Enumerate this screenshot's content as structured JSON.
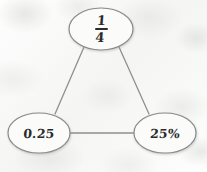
{
  "diagram": {
    "style": {
      "background_color": "#f6f6f5",
      "node_fill_color": "#fbfbfa",
      "node_stroke_color": "#8a8a8a",
      "edge_stroke_color": "#8f8f8f",
      "text_color": "#2b2b2b"
    },
    "nodes": [
      {
        "id": "fraction-node",
        "label": "1/4",
        "kind": "fraction",
        "numerator": "1",
        "denominator": "4",
        "cx": 101,
        "cy": 29,
        "rx": 32,
        "ry": 21
      },
      {
        "id": "decimal-node",
        "label": "0.25",
        "kind": "text",
        "cx": 39,
        "cy": 133,
        "rx": 31,
        "ry": 20
      },
      {
        "id": "percent-node",
        "label": "25%",
        "kind": "text",
        "cx": 165,
        "cy": 133,
        "rx": 31,
        "ry": 20
      }
    ],
    "edges": [
      {
        "id": "edge-fraction-decimal",
        "from": "fraction-node",
        "to": "decimal-node",
        "x1": 84,
        "y1": 47,
        "x2": 55,
        "y2": 114
      },
      {
        "id": "edge-fraction-percent",
        "from": "fraction-node",
        "to": "percent-node",
        "x1": 119,
        "y1": 47,
        "x2": 149,
        "y2": 114
      },
      {
        "id": "edge-decimal-percent",
        "from": "decimal-node",
        "to": "percent-node",
        "x1": 70,
        "y1": 133,
        "x2": 134,
        "y2": 133
      }
    ]
  }
}
